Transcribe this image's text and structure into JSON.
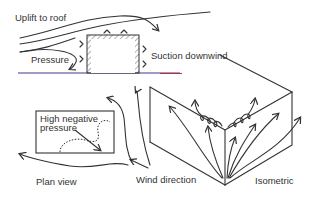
{
  "diagram": {
    "labels": {
      "uplift": "Uplift to roof",
      "pressure": "Pressure",
      "suction": "Suction downwind",
      "high_negative_1": "High negative",
      "high_negative_2": "pressure",
      "plan_view": "Plan view",
      "wind_direction": "Wind direction",
      "isometric": "Isometric"
    },
    "colors": {
      "ink": "#333333",
      "ground_blue": "#3a3a8a",
      "ground_red": "#c0302a"
    }
  }
}
